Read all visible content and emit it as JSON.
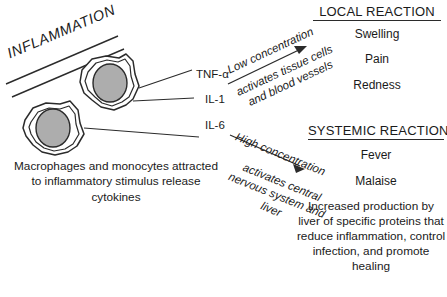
{
  "figure": {
    "banner_label": "INFLAMMATION",
    "cells_caption": "Macrophages and monocytes attracted to inflammatory stimulus release cytokines"
  },
  "cytokines": [
    {
      "name": "TNF-α"
    },
    {
      "name": "IL-1"
    },
    {
      "name": "IL-6"
    }
  ],
  "pathways": {
    "low": {
      "title": "Low concentration",
      "body": "activates tissue cells and blood vessels"
    },
    "high": {
      "title": "High concentration",
      "body": "activates central nervous system and liver"
    }
  },
  "local_reaction": {
    "heading": "LOCAL REACTION",
    "items": [
      "Swelling",
      "Pain",
      "Redness"
    ]
  },
  "systemic_reaction": {
    "heading": "SYSTEMIC REACTION",
    "items": [
      "Fever",
      "Malaise"
    ],
    "paragraph": "Increased production by liver of specific proteins that reduce inflammation, control infection, and promote healing"
  },
  "colors": {
    "ink": "#1a1a1a",
    "stroke": "#2b2b2b",
    "nucleus_fill": "#adadad",
    "cytoplasm_fill": "#ffffff",
    "background": "#ffffff"
  }
}
